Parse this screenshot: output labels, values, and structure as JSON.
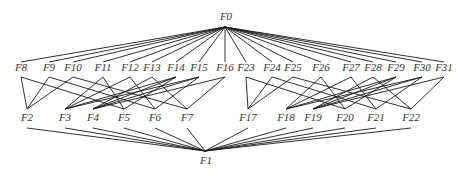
{
  "diagram": {
    "type": "hierarchy-lattice",
    "root": {
      "id": "F0",
      "label": "F0",
      "x": 226,
      "y": 16,
      "anchor": [
        225,
        27
      ]
    },
    "sink": {
      "id": "F1",
      "label": "F1",
      "x": 206,
      "y": 160,
      "anchor": [
        205,
        151
      ]
    },
    "top_row": [
      {
        "id": "F8",
        "label": "F8",
        "x": 21,
        "y": 67
      },
      {
        "id": "F9",
        "label": "F9",
        "x": 49,
        "y": 67
      },
      {
        "id": "F10",
        "label": "F10",
        "x": 73,
        "y": 67
      },
      {
        "id": "F11",
        "label": "F11",
        "x": 103,
        "y": 67
      },
      {
        "id": "F12",
        "label": "F12",
        "x": 130,
        "y": 67
      },
      {
        "id": "F13",
        "label": "F13",
        "x": 152,
        "y": 67
      },
      {
        "id": "F14",
        "label": "F14",
        "x": 176,
        "y": 67
      },
      {
        "id": "F15",
        "label": "F15",
        "x": 199,
        "y": 67
      },
      {
        "id": "F16",
        "label": "F16",
        "x": 225,
        "y": 67
      },
      {
        "id": "F23",
        "label": "F23",
        "x": 246,
        "y": 67
      },
      {
        "id": "F24",
        "label": "F24",
        "x": 272,
        "y": 67
      },
      {
        "id": "F25",
        "label": "F25",
        "x": 293,
        "y": 67
      },
      {
        "id": "F26",
        "label": "F26",
        "x": 321,
        "y": 67
      },
      {
        "id": "F27",
        "label": "F27",
        "x": 351,
        "y": 67
      },
      {
        "id": "F28",
        "label": "F28",
        "x": 373,
        "y": 67
      },
      {
        "id": "F29",
        "label": "F29",
        "x": 396,
        "y": 67
      },
      {
        "id": "F30",
        "label": "F30",
        "x": 422,
        "y": 67
      },
      {
        "id": "F31",
        "label": "F31",
        "x": 444,
        "y": 67
      }
    ],
    "middle_row": [
      {
        "id": "F2",
        "label": "F2",
        "x": 27,
        "y": 117
      },
      {
        "id": "F3",
        "label": "F3",
        "x": 65,
        "y": 117
      },
      {
        "id": "F4",
        "label": "F4",
        "x": 93,
        "y": 117
      },
      {
        "id": "F5",
        "label": "F5",
        "x": 124,
        "y": 117
      },
      {
        "id": "F6",
        "label": "F6",
        "x": 155,
        "y": 117
      },
      {
        "id": "F7",
        "label": "F7",
        "x": 187,
        "y": 117
      },
      {
        "id": "F17",
        "label": "F17",
        "x": 248,
        "y": 117
      },
      {
        "id": "F18",
        "label": "F18",
        "x": 286,
        "y": 117
      },
      {
        "id": "F19",
        "label": "F19",
        "x": 313,
        "y": 117
      },
      {
        "id": "F20",
        "label": "F20",
        "x": 345,
        "y": 117
      },
      {
        "id": "F21",
        "label": "F21",
        "x": 376,
        "y": 117
      },
      {
        "id": "F22",
        "label": "F22",
        "x": 411,
        "y": 117
      }
    ],
    "edges_top_to_middle": [
      [
        "F8",
        "F2"
      ],
      [
        "F9",
        "F2"
      ],
      [
        "F10",
        "F2"
      ],
      [
        "F11",
        "F3"
      ],
      [
        "F12",
        "F3"
      ],
      [
        "F14",
        "F3"
      ],
      [
        "F15",
        "F3"
      ],
      [
        "F13",
        "F4"
      ],
      [
        "F14",
        "F4"
      ],
      [
        "F15",
        "F4"
      ],
      [
        "F16",
        "F4"
      ],
      [
        "F8",
        "F5"
      ],
      [
        "F11",
        "F5"
      ],
      [
        "F14",
        "F5"
      ],
      [
        "F9",
        "F6"
      ],
      [
        "F12",
        "F6"
      ],
      [
        "F15",
        "F6"
      ],
      [
        "F10",
        "F7"
      ],
      [
        "F13",
        "F7"
      ],
      [
        "F16",
        "F7"
      ],
      [
        "F23",
        "F17"
      ],
      [
        "F24",
        "F17"
      ],
      [
        "F25",
        "F17"
      ],
      [
        "F26",
        "F18"
      ],
      [
        "F27",
        "F18"
      ],
      [
        "F29",
        "F18"
      ],
      [
        "F30",
        "F18"
      ],
      [
        "F28",
        "F19"
      ],
      [
        "F29",
        "F19"
      ],
      [
        "F30",
        "F19"
      ],
      [
        "F31",
        "F19"
      ],
      [
        "F23",
        "F20"
      ],
      [
        "F26",
        "F20"
      ],
      [
        "F29",
        "F20"
      ],
      [
        "F24",
        "F21"
      ],
      [
        "F27",
        "F21"
      ],
      [
        "F30",
        "F21"
      ],
      [
        "F25",
        "F22"
      ],
      [
        "F28",
        "F22"
      ],
      [
        "F31",
        "F22"
      ]
    ]
  }
}
